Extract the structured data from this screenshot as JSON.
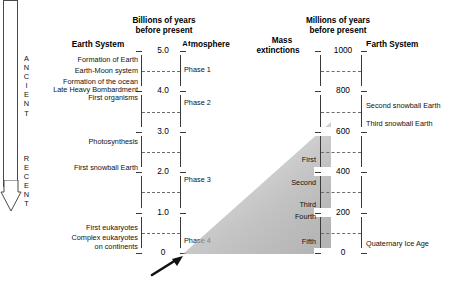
{
  "diagram": {
    "direction_arrow": {
      "top_word": "ANCIENT",
      "bottom_word": "RECENT"
    },
    "left_panel": {
      "axis_title_line1": "Billions of years",
      "axis_title_line2": "before present",
      "column_left_header": "Earth System",
      "column_right_header": "Atmosphere",
      "axis_unit": "billions of years",
      "ticks": [
        {
          "label": "5.0",
          "value": 5.0
        },
        {
          "label": "4.0",
          "value": 4.0
        },
        {
          "label": "3.0",
          "value": 3.0
        },
        {
          "label": "2.0",
          "value": 2.0
        },
        {
          "label": "1.0",
          "value": 1.0
        },
        {
          "label": "0",
          "value": 0.0
        }
      ],
      "axis_max": 5.0,
      "axis_min": 0.0,
      "events": [
        {
          "label": "Formation of Earth",
          "value": 4.55
        },
        {
          "label": "Earth-Moon system",
          "value": 4.4
        },
        {
          "label": "Formation of the ocean",
          "value": 4.2
        },
        {
          "label": "Late Heavy Bombardment",
          "value": 4.0
        },
        {
          "label": "First organisms",
          "value": 3.85
        },
        {
          "label": "Photosynthesis",
          "value": 3.0
        },
        {
          "label": "First snowball Earth",
          "value": 2.3
        },
        {
          "label": "First eukaryotes",
          "value": 0.45
        },
        {
          "label": "Complex eukaryotes",
          "value": 0.2
        },
        {
          "label": "on continents",
          "value": 0.12
        }
      ],
      "atmosphere_phases": [
        {
          "label": "Phase 1",
          "value": 4.35
        },
        {
          "label": "Phase 2",
          "value": 3.9
        },
        {
          "label": "Phase 3",
          "value": 2.05
        },
        {
          "label": "Phase 4",
          "value": 0.25
        }
      ]
    },
    "right_panel": {
      "axis_title_line1": "Millions of years",
      "axis_title_line2": "before present",
      "column_left_header_line1": "Mass",
      "column_left_header_line2": "extinctions",
      "column_right_header": "Earth System",
      "axis_unit": "millions of years",
      "ticks": [
        {
          "label": "1000",
          "value": 1000
        },
        {
          "label": "800",
          "value": 800
        },
        {
          "label": "600",
          "value": 600
        },
        {
          "label": "400",
          "value": 400
        },
        {
          "label": "200",
          "value": 200
        },
        {
          "label": "0",
          "value": 0
        }
      ],
      "axis_max": 1000,
      "axis_min": 0,
      "mass_extinctions": [
        {
          "label": "First",
          "value": 445
        },
        {
          "label": "Second",
          "value": 375
        },
        {
          "label": "Third",
          "value": 252
        },
        {
          "label": "Fourth",
          "value": 201
        },
        {
          "label": "Fifth",
          "value": 66
        }
      ],
      "events": [
        {
          "label": "Second snowball Earth",
          "value": 710
        },
        {
          "label": "Third snowball Earth",
          "value": 635
        },
        {
          "label": "Quaternary Ice Age",
          "value": 25
        }
      ]
    },
    "colors": {
      "line": "#3a3a3a",
      "dashed": "#6d6d6d",
      "text": "#111111",
      "wedge": "#b4b4b4",
      "background": "#ffffff"
    }
  }
}
